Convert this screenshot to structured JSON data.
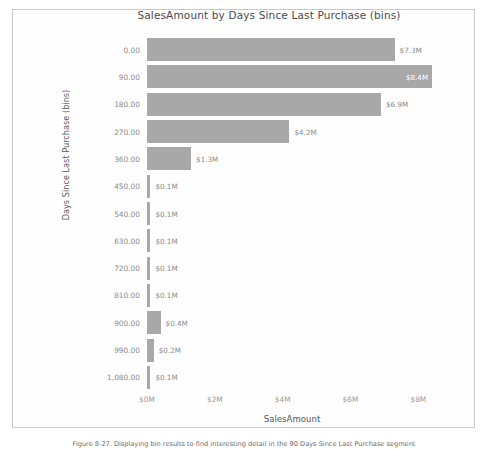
{
  "figure": {
    "caption": "Figure 8-27. Displaying bin results to find interesting detail in the 90 Days Since Last Purchase segment"
  },
  "chart_data": {
    "type": "bar",
    "orientation": "horizontal",
    "title": "SalesAmount by Days Since Last Purchase (bins)",
    "xlabel": "SalesAmount",
    "ylabel": "Days Since Last Purchase (bins)",
    "categories": [
      "0.00",
      "90.00",
      "180.00",
      "270.00",
      "360.00",
      "450.00",
      "540.00",
      "630.00",
      "720.00",
      "810.00",
      "900.00",
      "990.00",
      "1,080.00"
    ],
    "values": [
      7.3,
      8.4,
      6.9,
      4.2,
      1.3,
      0.1,
      0.1,
      0.1,
      0.1,
      0.1,
      0.4,
      0.2,
      0.1
    ],
    "value_labels": [
      "$7.3M",
      "$8.4M",
      "$6.9M",
      "$4.2M",
      "$1.3M",
      "$0.1M",
      "$0.1M",
      "$0.1M",
      "$0.1M",
      "$0.1M",
      "$0.4M",
      "$0.2M",
      "$0.1M"
    ],
    "label_placement": [
      "outside",
      "inside",
      "outside",
      "outside",
      "outside",
      "outside",
      "outside",
      "outside",
      "outside",
      "outside",
      "outside",
      "outside",
      "outside"
    ],
    "xticks": [
      0,
      2,
      4,
      6,
      8
    ],
    "xtick_labels": [
      "$0M",
      "$2M",
      "$4M",
      "$6M",
      "$8M"
    ],
    "xlim": [
      0,
      8.55
    ],
    "grid": false,
    "legend": null,
    "bar_color": "#9c9c9c",
    "units": "millions USD"
  }
}
